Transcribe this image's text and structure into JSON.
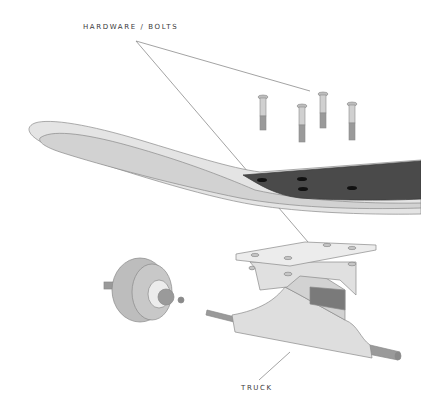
{
  "diagram": {
    "labels": {
      "hardware": "HARDWARE / BOLTS",
      "truck": "TRUCK"
    },
    "parts": [
      {
        "name": "hardware-bolts",
        "count": 4
      },
      {
        "name": "deck"
      },
      {
        "name": "grip-tape"
      },
      {
        "name": "truck"
      },
      {
        "name": "wheel"
      }
    ],
    "colors": {
      "outline": "#8a8a8a",
      "part_fill_light": "#e4e4e4",
      "part_fill_mid": "#cfcfcf",
      "grip_tape": "#4a4a4a",
      "bushing": "#7a7a7a",
      "wheel": "#bdbdbd",
      "leader_line": "#8c8c8c",
      "label_text": "#3a3a3a"
    }
  }
}
